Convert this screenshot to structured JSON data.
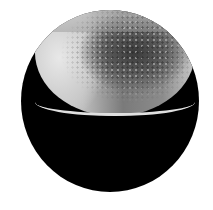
{
  "image": {
    "subject": "microscopy-specimen",
    "description": "Grayscale electron-microscope style image of a hemispherical textured shell inside a black circular field",
    "colors": {
      "background": "#ffffff",
      "disc": "#000000",
      "specimen_light": "#d8d8d8",
      "specimen_dark": "#3a3a3a"
    }
  }
}
